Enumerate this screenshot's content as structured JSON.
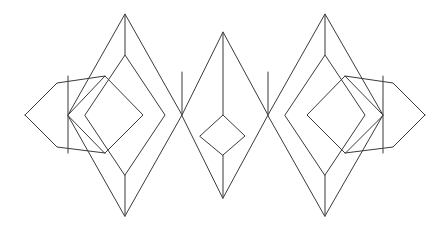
{
  "figure": {
    "background_color": "#ffffff",
    "stroke_color": "#3a3a3a",
    "vertical_stroke_color": "#4a4a4a",
    "stroke_width": 1,
    "canvas": {
      "width": 446,
      "height": 229
    },
    "unit_count": 3,
    "symmetry": "mirror-symmetric about vertical center line",
    "midline_y": 115,
    "center_x": 223
  },
  "chart_data": {
    "type": "diagram",
    "coordinate_space": {
      "width": 446,
      "height": 229,
      "origin": "top-left"
    },
    "nodes": [
      {
        "name": "left-outer-tip",
        "x": 25,
        "y": 115
      },
      {
        "name": "left-cross-node",
        "x": 68,
        "y": 115
      },
      {
        "name": "left-unit-apex",
        "x": 125,
        "y": 14
      },
      {
        "name": "left-unit-bottom",
        "x": 125,
        "y": 216
      },
      {
        "name": "left-inner-apex",
        "x": 125,
        "y": 55
      },
      {
        "name": "left-inner-bottom",
        "x": 125,
        "y": 175
      },
      {
        "name": "left-right-node",
        "x": 182,
        "y": 115
      },
      {
        "name": "center-apex",
        "x": 223,
        "y": 32
      },
      {
        "name": "center-bottom",
        "x": 223,
        "y": 198
      },
      {
        "name": "center-small-top",
        "x": 223,
        "y": 115
      },
      {
        "name": "center-small-bottom",
        "x": 223,
        "y": 155
      },
      {
        "name": "center-left-node",
        "x": 182,
        "y": 115
      },
      {
        "name": "center-right-node",
        "x": 268,
        "y": 115
      },
      {
        "name": "right-unit-apex",
        "x": 325,
        "y": 14
      },
      {
        "name": "right-unit-bottom",
        "x": 325,
        "y": 216
      },
      {
        "name": "right-inner-apex",
        "x": 325,
        "y": 55
      },
      {
        "name": "right-inner-bottom",
        "x": 325,
        "y": 175
      },
      {
        "name": "right-cross-node",
        "x": 383,
        "y": 115
      },
      {
        "name": "right-outer-tip",
        "x": 425,
        "y": 115
      }
    ],
    "shapes": [
      {
        "name": "left-unit-outer-diamond",
        "points": "68,115 125,14 182,115 125,216"
      },
      {
        "name": "left-unit-inner-diamond",
        "points": "85,115 125,55 165,115 125,175"
      },
      {
        "name": "left-unit-core-diamond",
        "points": "68,115 105,76 143,115 105,153"
      },
      {
        "name": "left-small-edge-diamond",
        "points": "25,115 57,83 90,115 57,147"
      },
      {
        "name": "center-unit-outer-diamond",
        "points": "182,115 223,32 268,115 223,198"
      },
      {
        "name": "center-small-diamond",
        "points": "200,136 223,115 245,136 223,155"
      },
      {
        "name": "right-unit-outer-diamond",
        "points": "268,115 325,14 383,115 325,216"
      },
      {
        "name": "right-unit-inner-diamond",
        "points": "285,115 325,55 365,115 325,175"
      },
      {
        "name": "right-unit-core-diamond",
        "points": "383,115 345,76 307,115 345,153"
      },
      {
        "name": "right-small-edge-diamond",
        "points": "425,115 393,83 360,115 393,147"
      }
    ],
    "vertical_segments": [
      {
        "name": "left-apex-vertical",
        "x": 125,
        "y1": 14,
        "y2": 55
      },
      {
        "name": "left-bottom-vertical",
        "x": 125,
        "y1": 175,
        "y2": 216
      },
      {
        "name": "left-cross-vertical",
        "x": 68,
        "y1": 76,
        "y2": 153
      },
      {
        "name": "center-apex-vertical",
        "x": 223,
        "y1": 32,
        "y2": 115
      },
      {
        "name": "center-bottom-vertical",
        "x": 223,
        "y1": 155,
        "y2": 198
      },
      {
        "name": "center-left-vertical",
        "x": 182,
        "y1": 72,
        "y2": 115
      },
      {
        "name": "center-right-vertical",
        "x": 268,
        "y1": 72,
        "y2": 115
      },
      {
        "name": "right-apex-vertical",
        "x": 325,
        "y1": 14,
        "y2": 55
      },
      {
        "name": "right-bottom-vertical",
        "x": 325,
        "y1": 175,
        "y2": 216
      },
      {
        "name": "right-cross-vertical",
        "x": 383,
        "y1": 76,
        "y2": 153
      }
    ],
    "diagonal_segments": [
      {
        "name": "left-tip-upper",
        "x1": 25,
        "y1": 115,
        "x2": 57,
        "y2": 83
      },
      {
        "name": "left-tip-lower",
        "x1": 25,
        "y1": 115,
        "x2": 57,
        "y2": 147
      },
      {
        "name": "left-edge-upper-in",
        "x1": 57,
        "y1": 83,
        "x2": 105,
        "y2": 76
      },
      {
        "name": "left-edge-lower-in",
        "x1": 57,
        "y1": 147,
        "x2": 105,
        "y2": 153
      }
    ]
  }
}
